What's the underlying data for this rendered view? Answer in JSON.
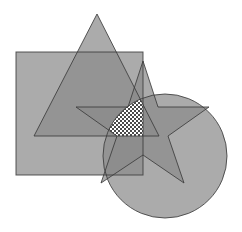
{
  "diagram": {
    "type": "overlapping-shapes",
    "width": 242,
    "height": 232,
    "background": "#ffffff",
    "fill": "#8a8a8a",
    "fill_opacity": 0.72,
    "stroke": "#3c3c3c",
    "stroke_width": 1,
    "shapes": {
      "square": {
        "x": 16,
        "y": 52,
        "width": 127,
        "height": 123
      },
      "triangle": {
        "points": "97,14 34,136 159,136"
      },
      "star": {
        "points": "143,61 158,107 209,107 168,136 184,183 143,155 101,183 117,136 76,107 128,107"
      },
      "circle": {
        "cx": 165,
        "cy": 156,
        "r": 62
      }
    },
    "highlight": {
      "description": "Region common to all four shapes",
      "pattern": "checkerboard",
      "pattern_colors": [
        "#ffffff",
        "#4a4a4a"
      ],
      "pattern_cell": 2
    }
  }
}
